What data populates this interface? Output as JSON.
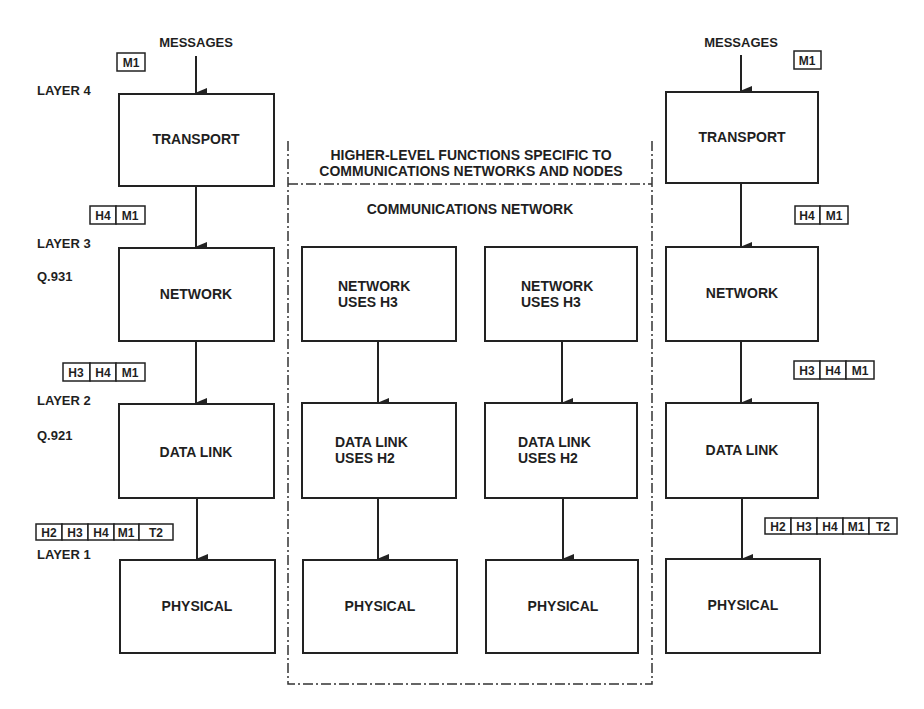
{
  "left_stack": {
    "messages_label": "MESSAGES",
    "layers": [
      {
        "name": "LAYER 4",
        "protocol": "",
        "box": "TRANSPORT",
        "headers_in": [
          "M1"
        ]
      },
      {
        "name": "LAYER 3",
        "protocol": "Q.931",
        "box": "NETWORK",
        "headers_in": [
          "H4",
          "M1"
        ]
      },
      {
        "name": "LAYER 2",
        "protocol": "Q.921",
        "box": "DATA LINK",
        "headers_in": [
          "H3",
          "H4",
          "M1"
        ]
      },
      {
        "name": "LAYER 1",
        "protocol": "",
        "box": "PHYSICAL",
        "headers_in": [
          "H2",
          "H3",
          "H4",
          "M1",
          "T2"
        ]
      }
    ]
  },
  "middle": {
    "title_line1": "HIGHER-LEVEL FUNCTIONS SPECIFIC TO",
    "title_line2": "COMMUNICATIONS NETWORKS AND NODES",
    "subtitle": "COMMUNICATIONS NETWORK",
    "nodes": [
      {
        "network_l1": "NETWORK",
        "network_l2": "USES H3",
        "datalink_l1": "DATA LINK",
        "datalink_l2": "USES H2",
        "physical": "PHYSICAL"
      },
      {
        "network_l1": "NETWORK",
        "network_l2": "USES H3",
        "datalink_l1": "DATA LINK",
        "datalink_l2": "USES H2",
        "physical": "PHYSICAL"
      }
    ]
  },
  "right_stack": {
    "messages_label": "MESSAGES",
    "boxes": [
      "TRANSPORT",
      "NETWORK",
      "DATA LINK",
      "PHYSICAL"
    ],
    "header_tags": [
      [
        "M1"
      ],
      [
        "H4",
        "M1"
      ],
      [
        "H3",
        "H4",
        "M1"
      ],
      [
        "H2",
        "H3",
        "H4",
        "M1",
        "T2"
      ]
    ]
  },
  "colors": {
    "ink": "#1f1f1f",
    "background": "#ffffff"
  }
}
